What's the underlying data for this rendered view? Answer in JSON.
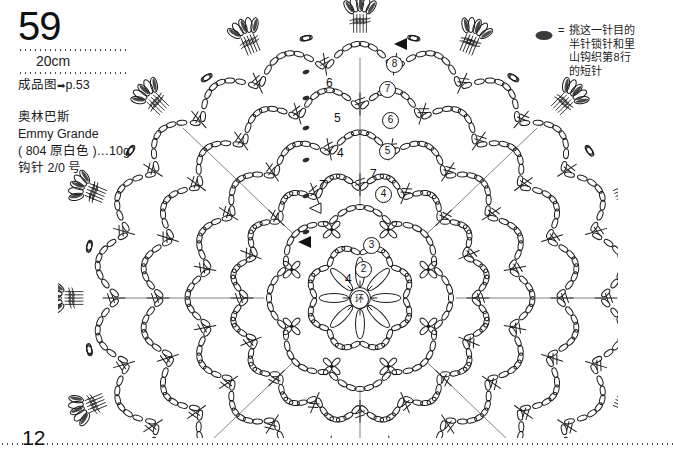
{
  "header": {
    "pattern_number": "59",
    "size": "20cm",
    "finished_label": "成品图",
    "finished_arrow": "➡",
    "finished_page": "p.53"
  },
  "materials": {
    "brand": "奥林巴斯",
    "yarn": "Emmy Grande",
    "color": "( 804 原白色 )…10g",
    "hook": "钩针 2/0 号"
  },
  "legend": {
    "symbol_icon": "filled-oval-icon",
    "equals": "=",
    "lines": [
      "挑这一针目的",
      "半针锁针和里",
      "山钩织第8行",
      "的短针"
    ]
  },
  "chart_data": {
    "type": "diagram",
    "center_label": "环",
    "round_labels": [
      "②",
      "③",
      "④",
      "⑤",
      "⑥",
      "⑦",
      "⑧"
    ],
    "stitch_count_labels": [
      "4",
      "7",
      "7",
      "4",
      "5",
      "6"
    ],
    "markers": [
      {
        "name": "start-arrow-round8",
        "glyph": "◀"
      },
      {
        "name": "start-arrow-round3",
        "glyph": "◀"
      }
    ],
    "symmetry": 8,
    "rounds": 8
  },
  "footer": {
    "page_number": "12"
  },
  "labels": {
    "n4a": "4",
    "n7a": "7",
    "n7b": "7",
    "n4b": "4",
    "n5": "5",
    "n6": "6",
    "r2": "2",
    "r3": "3",
    "r4": "4",
    "r5": "5",
    "r6": "6",
    "r7": "7",
    "r8": "8",
    "center": "环"
  }
}
